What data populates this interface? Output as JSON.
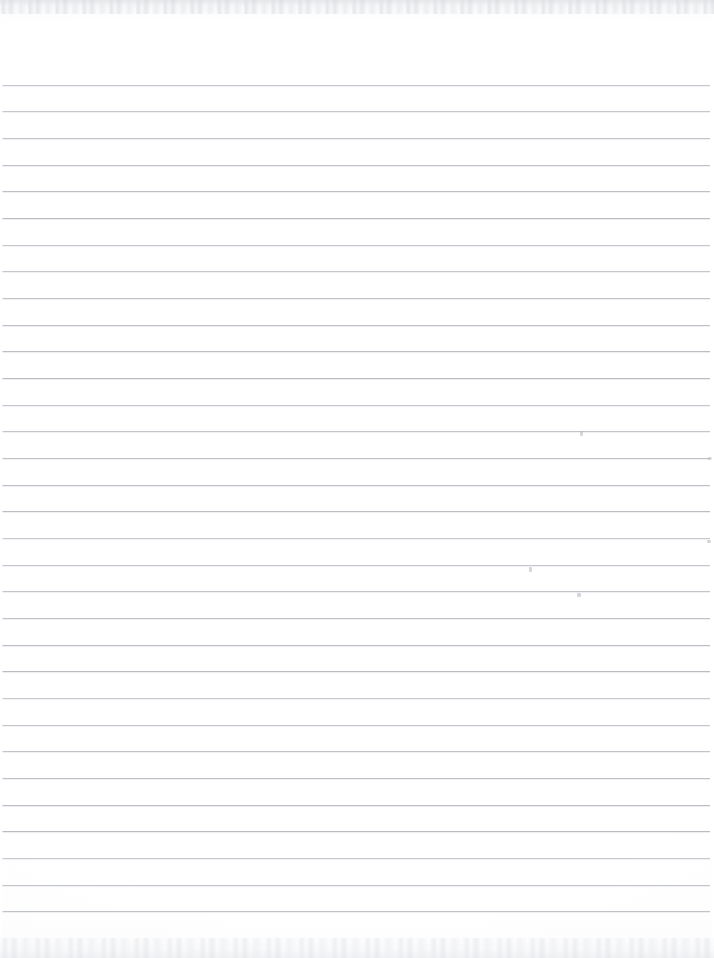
{
  "document": {
    "kind": "scanned-ruled-notebook-page",
    "title": "Blank Lined Notebook Page",
    "content_text": "",
    "page_width": 714,
    "page_height": 958,
    "background_color": "#ffffff",
    "has_handwriting": false,
    "has_printed_text": false
  },
  "ruling": {
    "line_color": "#b9bdc2",
    "line_highlight_color": "#e9ebee",
    "line_thickness": 1,
    "line_count": 32,
    "first_line_y": 84.5,
    "line_spacing": 26.67,
    "line_start_x": 2,
    "line_end_x": 710,
    "has_margin_rule": false,
    "orientation": "horizontal"
  },
  "scan_artifacts": {
    "top_edge_band_height": 14,
    "bottom_edge_band_height": 20,
    "edge_noise_color": "#e2e4e7",
    "vignette_color": "#f3f4f6",
    "specks": [
      {
        "x": 580,
        "y": 431,
        "w": 3,
        "h": 5,
        "label": "speck-upper-right"
      },
      {
        "x": 708,
        "y": 457,
        "w": 4,
        "h": 3,
        "label": "speck-right-margin"
      },
      {
        "x": 529,
        "y": 567,
        "w": 3,
        "h": 5,
        "label": "speck-center-right"
      },
      {
        "x": 577,
        "y": 593,
        "w": 4,
        "h": 4,
        "label": "speck-lower-center"
      },
      {
        "x": 707,
        "y": 540,
        "w": 4,
        "h": 3,
        "label": "speck-right-edge"
      }
    ]
  }
}
